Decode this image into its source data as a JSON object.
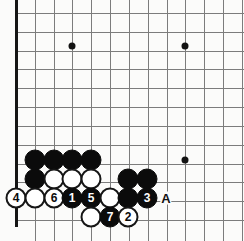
{
  "diagram": {
    "type": "go-board-diagram",
    "board": {
      "spacing": 18.83,
      "origin_x": 16,
      "origin_y": 13,
      "cols": 12,
      "rows": 11,
      "left_edge_x": 16,
      "bottom_edge_y": 225,
      "line_color": "#7c7c7c",
      "edge_color": "#151515",
      "background": "#fbfbfa"
    },
    "star_points": [
      {
        "name": "star-point-upper-left",
        "x": 72,
        "y": 46
      },
      {
        "name": "star-point-upper-right",
        "x": 185,
        "y": 46
      },
      {
        "name": "star-point-lower-right",
        "x": 185,
        "y": 160
      }
    ],
    "stones": [
      {
        "name": "black-stone-a1",
        "color": "black",
        "x": 35,
        "y": 160,
        "label": ""
      },
      {
        "name": "black-stone-b1",
        "color": "black",
        "x": 54,
        "y": 160,
        "label": ""
      },
      {
        "name": "black-stone-c1",
        "color": "black",
        "x": 72,
        "y": 160,
        "label": ""
      },
      {
        "name": "black-stone-d1",
        "color": "black",
        "x": 91,
        "y": 160,
        "label": ""
      },
      {
        "name": "black-stone-a2",
        "color": "black",
        "x": 35,
        "y": 179,
        "label": ""
      },
      {
        "name": "white-stone-b2",
        "color": "white",
        "x": 54,
        "y": 179,
        "label": ""
      },
      {
        "name": "white-stone-c2",
        "color": "white",
        "x": 72,
        "y": 179,
        "label": ""
      },
      {
        "name": "white-stone-d2",
        "color": "white",
        "x": 91,
        "y": 179,
        "label": ""
      },
      {
        "name": "black-stone-f2",
        "color": "black",
        "x": 128,
        "y": 179,
        "label": ""
      },
      {
        "name": "black-stone-g2",
        "color": "black",
        "x": 147,
        "y": 179,
        "label": ""
      },
      {
        "name": "white-stone-move-4",
        "color": "white",
        "x": 16,
        "y": 198,
        "label": "4"
      },
      {
        "name": "white-stone-a3",
        "color": "white",
        "x": 35,
        "y": 198,
        "label": ""
      },
      {
        "name": "white-stone-move-6",
        "color": "white",
        "x": 54,
        "y": 198,
        "label": "6"
      },
      {
        "name": "black-stone-move-1",
        "color": "black",
        "x": 72,
        "y": 198,
        "label": "1"
      },
      {
        "name": "black-stone-move-5",
        "color": "black",
        "x": 91,
        "y": 198,
        "label": "5"
      },
      {
        "name": "white-stone-e3",
        "color": "white",
        "x": 110,
        "y": 198,
        "label": ""
      },
      {
        "name": "black-stone-f3",
        "color": "black",
        "x": 128,
        "y": 198,
        "label": ""
      },
      {
        "name": "black-stone-move-3",
        "color": "black",
        "x": 147,
        "y": 198,
        "label": "3"
      },
      {
        "name": "white-stone-d4",
        "color": "white",
        "x": 91,
        "y": 217,
        "label": ""
      },
      {
        "name": "black-stone-move-7",
        "color": "black",
        "x": 110,
        "y": 217,
        "label": "7"
      },
      {
        "name": "white-stone-move-2",
        "color": "white",
        "x": 128,
        "y": 217,
        "label": "2"
      }
    ],
    "markers": [
      {
        "name": "point-marker-a",
        "x": 166,
        "y": 198,
        "label": "A"
      }
    ]
  }
}
